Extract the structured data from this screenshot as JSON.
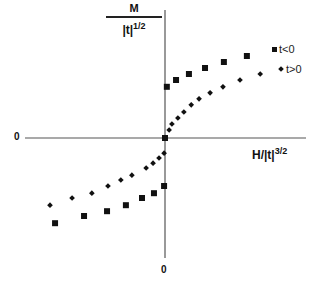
{
  "chart_data": {
    "type": "scatter",
    "title": "",
    "ylabel": {
      "numerator": "M",
      "denominator": "|t|",
      "exponent": "1/2"
    },
    "xlabel": {
      "base": "H/|t|",
      "exponent": "3/2"
    },
    "x_zero_label": "0",
    "y_zero_label": "0",
    "grid": false,
    "legend_position": "upper right",
    "xlim": [
      -3.04,
      3.04
    ],
    "ylim": [
      -3.0,
      3.2
    ],
    "series": [
      {
        "name": "t<0",
        "marker": "square",
        "points": [
          [
            -2.39,
            -2.13
          ],
          [
            -1.76,
            -1.95
          ],
          [
            -1.26,
            -1.83
          ],
          [
            -0.85,
            -1.68
          ],
          [
            -0.5,
            -1.5
          ],
          [
            -0.24,
            -1.38
          ],
          [
            -0.02,
            -1.2
          ],
          [
            0.04,
            1.28
          ],
          [
            0.24,
            1.45
          ],
          [
            0.52,
            1.6
          ],
          [
            0.87,
            1.75
          ],
          [
            1.28,
            1.9
          ],
          [
            1.78,
            2.05
          ]
        ]
      },
      {
        "name": "t>0",
        "marker": "diamond",
        "points": [
          [
            -2.5,
            -1.68
          ],
          [
            -2.02,
            -1.5
          ],
          [
            -1.59,
            -1.38
          ],
          [
            -1.24,
            -1.2
          ],
          [
            -0.96,
            -1.05
          ],
          [
            -0.72,
            -0.93
          ],
          [
            -0.41,
            -0.75
          ],
          [
            -0.26,
            -0.63
          ],
          [
            -0.13,
            -0.5
          ],
          [
            -0.02,
            -0.38
          ],
          [
            0.0,
            0.0
          ],
          [
            0.09,
            0.2
          ],
          [
            0.15,
            0.35
          ],
          [
            0.28,
            0.5
          ],
          [
            0.41,
            0.65
          ],
          [
            0.57,
            0.83
          ],
          [
            0.74,
            0.98
          ],
          [
            0.98,
            1.13
          ],
          [
            1.26,
            1.28
          ],
          [
            1.63,
            1.45
          ],
          [
            2.07,
            1.6
          ]
        ]
      }
    ]
  },
  "labels": {
    "y_num": "M",
    "y_den": "|t|",
    "y_exp": "1/2",
    "x_base": "H/|t|",
    "x_exp": "3/2",
    "zero_left": "0",
    "zero_bottom": "0"
  },
  "legend": [
    {
      "label": "t<0",
      "marker": "square"
    },
    {
      "label": "t>0",
      "marker": "diamond"
    }
  ]
}
